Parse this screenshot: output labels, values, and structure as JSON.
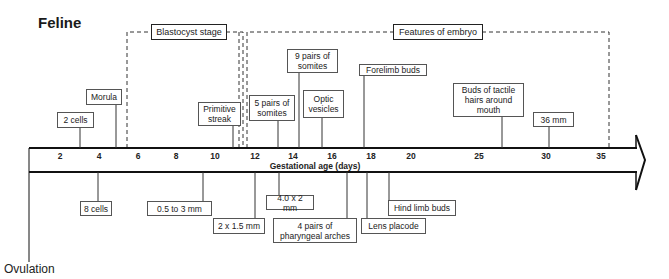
{
  "title": "Feline",
  "axis": {
    "title": "Gestational age (days)",
    "ticks": [
      {
        "label": "2",
        "x": 60
      },
      {
        "label": "4",
        "x": 99
      },
      {
        "label": "6",
        "x": 138
      },
      {
        "label": "8",
        "x": 176
      },
      {
        "label": "10",
        "x": 215
      },
      {
        "label": "12",
        "x": 255
      },
      {
        "label": "14",
        "x": 293
      },
      {
        "label": "16",
        "x": 332
      },
      {
        "label": "18",
        "x": 371
      },
      {
        "label": "20",
        "x": 411
      },
      {
        "label": "25",
        "x": 479
      },
      {
        "label": "30",
        "x": 546
      },
      {
        "label": "35",
        "x": 601
      }
    ]
  },
  "stages": {
    "blastocyst": "Blastocyst stage",
    "embryo": "Features of embryo"
  },
  "events_above": [
    {
      "label": "2 cells",
      "day": "3"
    },
    {
      "label": "Morula",
      "day": "5"
    },
    {
      "label": "Primitive streak",
      "day": "11"
    },
    {
      "label": "5  pairs of somites",
      "day": "13"
    },
    {
      "label": "9 pairs of somites",
      "day": "14"
    },
    {
      "label": "Optic vesicles",
      "day": "15"
    },
    {
      "label": "Forelimb buds",
      "day": "17"
    },
    {
      "label": "Buds of tactile hairs around mouth",
      "day": "26"
    },
    {
      "label": "36 mm",
      "day": "30"
    }
  ],
  "events_below": [
    {
      "label": "8 cells",
      "day": "4"
    },
    {
      "label": "0.5 to 3 mm",
      "day": "10"
    },
    {
      "label": "2 x 1.5 mm",
      "day": "12"
    },
    {
      "label": "4.0 x 2 mm",
      "day": "13"
    },
    {
      "label": "4 pairs of pharyngeal arches",
      "day": "17"
    },
    {
      "label": "Lens placode",
      "day": "18"
    },
    {
      "label": "Hind limb buds",
      "day": "19"
    }
  ],
  "ovulation": "Ovulation"
}
